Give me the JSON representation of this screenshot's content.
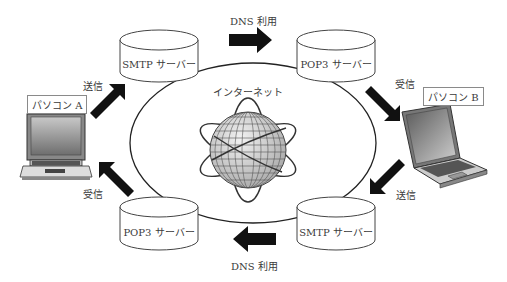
{
  "diagram": {
    "center_label": "インターネット",
    "servers": [
      {
        "id": "smtp-a",
        "label": "SMTP サーバー",
        "position": "top-left"
      },
      {
        "id": "pop3-b",
        "label": "POP3 サーバー",
        "position": "top-right"
      },
      {
        "id": "pop3-a",
        "label": "POP3 サーバー",
        "position": "bottom-left"
      },
      {
        "id": "smtp-b",
        "label": "SMTP サーバー",
        "position": "bottom-right"
      }
    ],
    "computers": [
      {
        "id": "pc-a",
        "label": "パソコン A"
      },
      {
        "id": "pc-b",
        "label": "パソコン B"
      }
    ],
    "arrows": {
      "top_dns": "DNS 利用",
      "bottom_dns": "DNS 利用",
      "pc_a_send": "送信",
      "pc_a_receive": "受信",
      "pc_b_receive": "受信",
      "pc_b_send": "送信"
    },
    "icons": {
      "globe": "globe-icon",
      "server": "database-cylinder-icon",
      "laptop": "laptop-icon"
    }
  }
}
